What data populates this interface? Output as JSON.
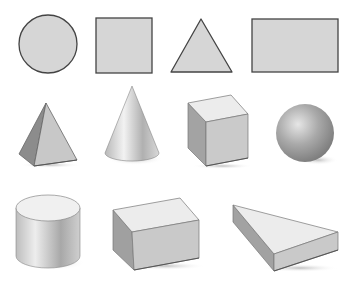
{
  "figure": {
    "colors": {
      "background": "#ffffff",
      "flat_fill": "#d6d6d6",
      "stroke": "#444444",
      "light_face": "#ececec",
      "mid_face": "#c8c8c8",
      "dark_face": "#9a9a9a"
    },
    "rows": [
      {
        "name": "2D shapes",
        "shapes": [
          {
            "id": "circle",
            "label": "Circle"
          },
          {
            "id": "square",
            "label": "Square"
          },
          {
            "id": "triangle",
            "label": "Triangle"
          },
          {
            "id": "rectangle",
            "label": "Rectangle"
          }
        ]
      },
      {
        "name": "3D solids row 1",
        "shapes": [
          {
            "id": "pyramid",
            "label": "Square pyramid"
          },
          {
            "id": "cone",
            "label": "Cone"
          },
          {
            "id": "cube",
            "label": "Cube"
          },
          {
            "id": "sphere",
            "label": "Sphere"
          }
        ]
      },
      {
        "name": "3D solids row 2",
        "shapes": [
          {
            "id": "cylinder",
            "label": "Cylinder"
          },
          {
            "id": "cuboid",
            "label": "Rectangular prism"
          },
          {
            "id": "triangular-prism",
            "label": "Triangular prism"
          }
        ]
      }
    ]
  }
}
